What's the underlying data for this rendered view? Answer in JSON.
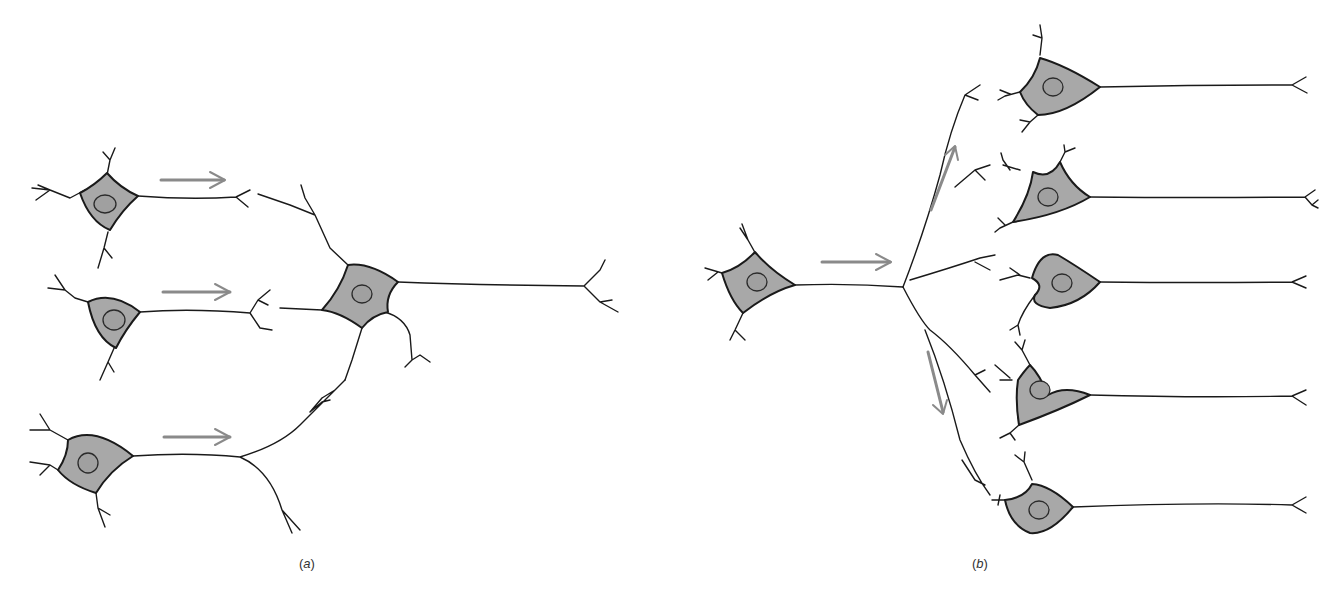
{
  "figure": {
    "colors": {
      "soma_fill": "#a8a8a8",
      "outline": "#1a1a1a",
      "arrow": "#8a8a8a",
      "background": "#ffffff"
    }
  },
  "panels": [
    {
      "id": "a",
      "label_open": "(",
      "label_letter": "a",
      "label_close": ")",
      "concept": "convergence",
      "presynaptic_neurons": 3,
      "postsynaptic_neurons": 1,
      "arrows": [
        "right",
        "right",
        "right"
      ]
    },
    {
      "id": "b",
      "label_open": "(",
      "label_letter": "b",
      "label_close": ")",
      "concept": "divergence",
      "presynaptic_neurons": 1,
      "postsynaptic_neurons": 5,
      "arrows": [
        "right",
        "up-right",
        "down"
      ]
    }
  ],
  "icons": {
    "neuron": "neuron-icon",
    "arrow": "arrow-icon"
  }
}
